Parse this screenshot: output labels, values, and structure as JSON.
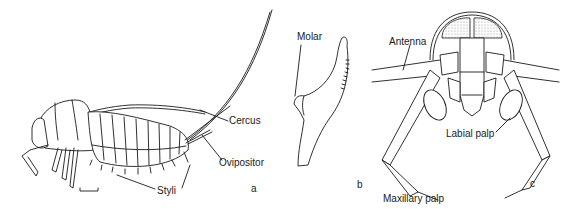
{
  "figure": {
    "panels": [
      {
        "letter": "a",
        "subject": "insect-lateral-view",
        "labels": {
          "cercus": "Cercus",
          "ovipositor": "Ovipositor",
          "styli": "Styli"
        },
        "scale_bar": true
      },
      {
        "letter": "b",
        "subject": "mandible",
        "labels": {
          "molar": "Molar"
        }
      },
      {
        "letter": "c",
        "subject": "head-ventral-view",
        "labels": {
          "antenna": "Antenna",
          "labial_palp": "Labial palp",
          "maxillary_palp": "Maxillary palp"
        }
      }
    ]
  },
  "colors": {
    "ink": "#1a1a1a",
    "background": "#ffffff",
    "stipple": "#d4d4d4"
  }
}
